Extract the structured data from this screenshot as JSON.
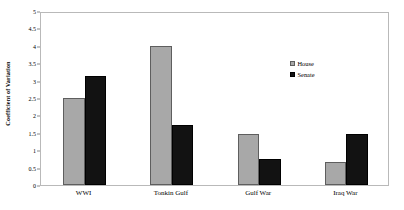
{
  "chart_data": {
    "type": "bar",
    "title": "",
    "subtitle": "",
    "xlabel": "",
    "ylabel": "Coefficient of Variation",
    "categories": [
      "WWI",
      "Tonkin Gulf",
      "Gulf War",
      "Iraq War"
    ],
    "series": [
      {
        "name": "House",
        "color": "#a8a8a8",
        "values": [
          2.5,
          4.0,
          1.47,
          0.66
        ]
      },
      {
        "name": "Senate",
        "color": "#121212",
        "values": [
          3.13,
          1.72,
          0.75,
          1.47
        ]
      }
    ],
    "ylim": [
      0,
      5
    ],
    "ytick_values": [
      0,
      0.5,
      1,
      1.5,
      2,
      2.5,
      3,
      3.5,
      4,
      4.5,
      5
    ],
    "ytick_labels": [
      "0",
      "0.5",
      "1",
      "1.5",
      "2",
      "2.5",
      "3",
      "3.5",
      "4",
      "4.5",
      "5"
    ],
    "grid": false,
    "legend_position": "upper right",
    "legend_entries": [
      "House",
      "Senate"
    ],
    "frame_color": "#b9b9b9",
    "background_color": "#ffffff"
  }
}
